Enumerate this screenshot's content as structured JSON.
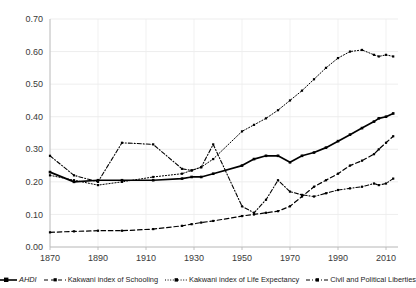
{
  "chart_data": {
    "type": "line",
    "title": "",
    "xlabel": "",
    "ylabel": "",
    "xlim": [
      1870,
      2015
    ],
    "ylim": [
      0.0,
      0.7
    ],
    "grid": true,
    "legend_position": "bottom",
    "y_ticks": [
      "0.00",
      "0.10",
      "0.20",
      "0.30",
      "0.40",
      "0.50",
      "0.60",
      "0.70"
    ],
    "y_tick_values": [
      0.0,
      0.1,
      0.2,
      0.3,
      0.4,
      0.5,
      0.6,
      0.7
    ],
    "x_ticks": [
      "1870",
      "1890",
      "1910",
      "1930",
      "1950",
      "1970",
      "1990",
      "2010"
    ],
    "x_tick_values": [
      1870,
      1890,
      1910,
      1930,
      1950,
      1970,
      1990,
      2010
    ],
    "series": [
      {
        "name": "AHDI",
        "style": "solid-thick-marker",
        "x": [
          1870,
          1880,
          1890,
          1900,
          1913,
          1925,
          1929,
          1933,
          1938,
          1950,
          1955,
          1960,
          1965,
          1970,
          1975,
          1980,
          1985,
          1990,
          1995,
          2000,
          2005,
          2007,
          2010,
          2013
        ],
        "values": [
          0.23,
          0.2,
          0.205,
          0.205,
          0.205,
          0.21,
          0.215,
          0.215,
          0.225,
          0.25,
          0.27,
          0.28,
          0.28,
          0.26,
          0.28,
          0.29,
          0.305,
          0.325,
          0.345,
          0.365,
          0.385,
          0.395,
          0.4,
          0.41
        ]
      },
      {
        "name": "Kakwani index of Schooling",
        "style": "dashed-marker",
        "x": [
          1870,
          1880,
          1890,
          1900,
          1913,
          1925,
          1929,
          1933,
          1938,
          1950,
          1955,
          1960,
          1965,
          1970,
          1975,
          1980,
          1985,
          1990,
          1995,
          2000,
          2005,
          2007,
          2010,
          2013
        ],
        "values": [
          0.045,
          0.048,
          0.05,
          0.05,
          0.055,
          0.065,
          0.07,
          0.075,
          0.08,
          0.095,
          0.1,
          0.105,
          0.11,
          0.125,
          0.155,
          0.185,
          0.205,
          0.225,
          0.25,
          0.265,
          0.285,
          0.3,
          0.32,
          0.34
        ]
      },
      {
        "name": "Kakwani index of Life Expectancy",
        "style": "dotted-marker",
        "x": [
          1870,
          1880,
          1890,
          1900,
          1913,
          1925,
          1929,
          1933,
          1938,
          1950,
          1955,
          1960,
          1965,
          1970,
          1975,
          1980,
          1985,
          1990,
          1995,
          2000,
          2005,
          2007,
          2010,
          2013
        ],
        "values": [
          0.22,
          0.205,
          0.19,
          0.2,
          0.215,
          0.225,
          0.235,
          0.245,
          0.27,
          0.355,
          0.375,
          0.395,
          0.42,
          0.45,
          0.48,
          0.515,
          0.55,
          0.58,
          0.6,
          0.605,
          0.59,
          0.585,
          0.59,
          0.585
        ]
      },
      {
        "name": "Civil and Political Liberties",
        "style": "dash-dot-marker",
        "x": [
          1870,
          1880,
          1890,
          1900,
          1913,
          1925,
          1929,
          1933,
          1938,
          1950,
          1955,
          1960,
          1965,
          1970,
          1975,
          1980,
          1985,
          1990,
          1995,
          2000,
          2005,
          2007,
          2010,
          2013
        ],
        "values": [
          0.28,
          0.22,
          0.2,
          0.32,
          0.315,
          0.24,
          0.235,
          0.245,
          0.315,
          0.125,
          0.105,
          0.145,
          0.205,
          0.17,
          0.16,
          0.155,
          0.165,
          0.175,
          0.18,
          0.185,
          0.195,
          0.19,
          0.195,
          0.21
        ]
      }
    ]
  },
  "legend": {
    "items": [
      {
        "label": "AHDI",
        "marker": "solid-line-square-marker",
        "italic": true
      },
      {
        "label": "Kakwani index of Schooling",
        "marker": "dashed-line-dot-marker",
        "italic": false
      },
      {
        "label": "Kakwani index of Life Expectancy",
        "marker": "dotted-line-triangle-marker",
        "italic": false
      },
      {
        "label": "Civil and Political Liberties",
        "marker": "dash-dot-line-triangle-marker",
        "italic": false
      }
    ]
  }
}
